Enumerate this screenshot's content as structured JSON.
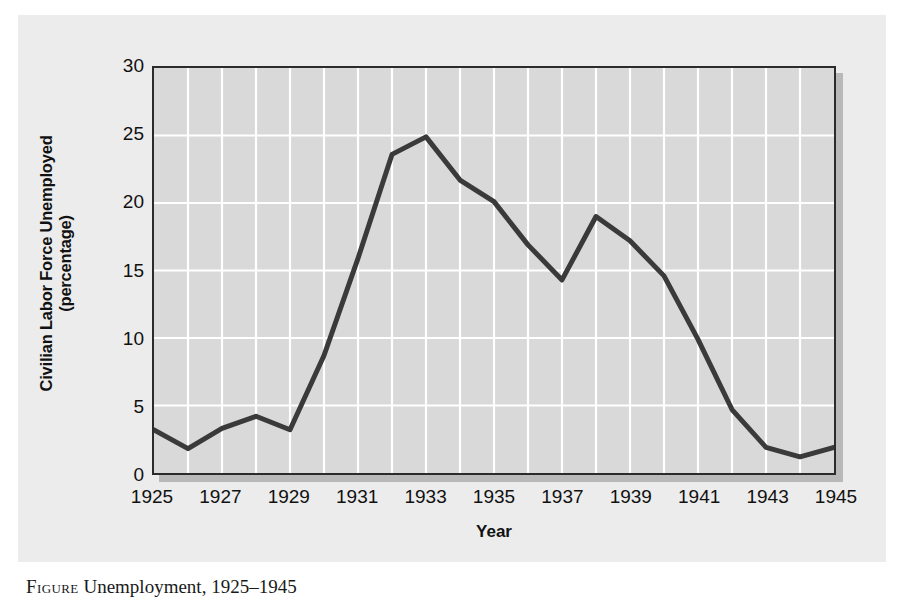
{
  "figure": {
    "caption_label": "Figure",
    "caption_text": "Unemployment, 1925–1945"
  },
  "axes": {
    "y_title_line1": "Civilian Labor Force Unemployed",
    "y_title_line2": "(percentage)",
    "x_title": "Year"
  },
  "colors": {
    "page_background": "#ffffff",
    "panel_background": "#ececec",
    "plot_background": "#d9d9d9",
    "gridline": "#ffffff",
    "axis_frame": "#2b2b2b",
    "series_line": "#3a3a3a",
    "shadow": "#b9b9b9",
    "text": "#111111"
  },
  "chart_data": {
    "type": "line",
    "title": "",
    "xlabel": "Year",
    "ylabel": "Civilian Labor Force Unemployed (percentage)",
    "xlim": [
      1925,
      1945
    ],
    "ylim": [
      0,
      30
    ],
    "grid": true,
    "legend": "none",
    "y_ticks": [
      0,
      5,
      10,
      15,
      20,
      25,
      30
    ],
    "y_tick_labels": [
      "0",
      "5",
      "10",
      "15",
      "20",
      "25",
      "30"
    ],
    "x_ticks": [
      1925,
      1927,
      1929,
      1931,
      1933,
      1935,
      1937,
      1939,
      1941,
      1943,
      1945
    ],
    "x_tick_labels": [
      "1925",
      "1927",
      "1929",
      "1931",
      "1933",
      "1935",
      "1937",
      "1939",
      "1941",
      "1943",
      "1945"
    ],
    "x_gridline_step": 1,
    "x": [
      1925,
      1926,
      1927,
      1928,
      1929,
      1930,
      1931,
      1932,
      1933,
      1934,
      1935,
      1936,
      1937,
      1938,
      1939,
      1940,
      1941,
      1942,
      1943,
      1944,
      1945
    ],
    "values": [
      3.2,
      1.8,
      3.3,
      4.2,
      3.2,
      8.7,
      15.9,
      23.6,
      24.9,
      21.7,
      20.1,
      16.9,
      14.3,
      19.0,
      17.2,
      14.6,
      9.9,
      4.7,
      1.9,
      1.2,
      1.9
    ],
    "series": [
      {
        "name": "Civilian labor force unemployed",
        "values": [
          3.2,
          1.8,
          3.3,
          4.2,
          3.2,
          8.7,
          15.9,
          23.6,
          24.9,
          21.7,
          20.1,
          16.9,
          14.3,
          19.0,
          17.2,
          14.6,
          9.9,
          4.7,
          1.9,
          1.2,
          1.9
        ]
      }
    ]
  }
}
